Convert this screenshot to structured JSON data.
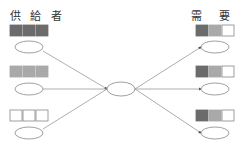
{
  "diagram": {
    "supplier_label": "供 給 者",
    "demand_label": "需 要 者",
    "colors": {
      "dark": "#6b6b6b",
      "mid": "#a9a9a9",
      "light": "#ffffff",
      "stroke": "#888888",
      "line": "#999999"
    },
    "suppliers": [
      {
        "blocks": [
          "dark",
          "dark",
          "dark"
        ]
      },
      {
        "blocks": [
          "mid",
          "mid",
          "mid"
        ]
      },
      {
        "blocks": [
          "light",
          "light",
          "light"
        ]
      }
    ],
    "demanders": [
      {
        "blocks": [
          "dark",
          "mid",
          "light"
        ]
      },
      {
        "blocks": [
          "dark",
          "mid",
          "light"
        ]
      },
      {
        "blocks": [
          "dark",
          "mid",
          "light"
        ]
      }
    ],
    "hub": "center-node"
  }
}
